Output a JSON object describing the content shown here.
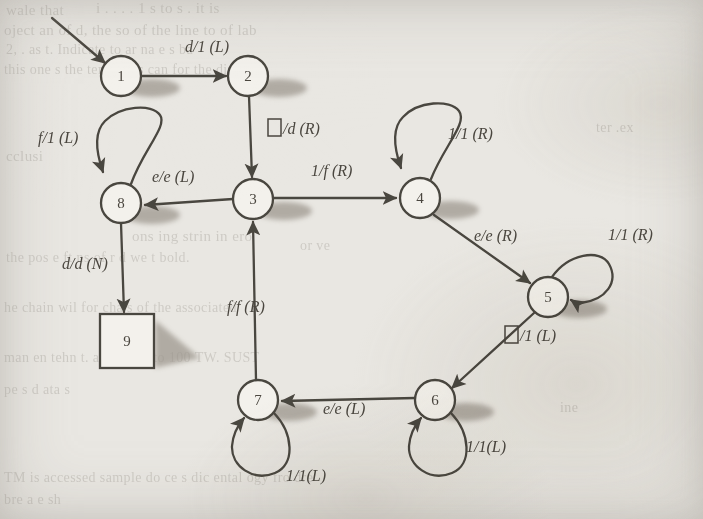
{
  "figure": {
    "type": "state-diagram",
    "background_color": "#e9e7e2",
    "ink_color": "#4a463f",
    "shadow_color": "#9a948b"
  },
  "states": [
    {
      "id": "1",
      "label": "1",
      "shape": "circle",
      "cx": 121,
      "cy": 76,
      "r": 20,
      "accepting": false
    },
    {
      "id": "2",
      "label": "2",
      "shape": "circle",
      "cx": 248,
      "cy": 76,
      "r": 20,
      "accepting": false
    },
    {
      "id": "3",
      "label": "3",
      "shape": "circle",
      "cx": 253,
      "cy": 199,
      "r": 20,
      "accepting": false
    },
    {
      "id": "4",
      "label": "4",
      "shape": "circle",
      "cx": 420,
      "cy": 198,
      "r": 20,
      "accepting": false
    },
    {
      "id": "5",
      "label": "5",
      "shape": "circle",
      "cx": 548,
      "cy": 297,
      "r": 20,
      "accepting": false
    },
    {
      "id": "6",
      "label": "6",
      "shape": "circle",
      "cx": 435,
      "cy": 400,
      "r": 20,
      "accepting": false
    },
    {
      "id": "7",
      "label": "7",
      "shape": "circle",
      "cx": 258,
      "cy": 400,
      "r": 20,
      "accepting": false
    },
    {
      "id": "8",
      "label": "8",
      "shape": "circle",
      "cx": 121,
      "cy": 203,
      "r": 20,
      "accepting": false
    },
    {
      "id": "9",
      "label": "9",
      "shape": "square",
      "cx": 127,
      "cy": 341,
      "r": 27,
      "accepting": true
    }
  ],
  "start": {
    "from_state": "1",
    "arrow_start_x": 52,
    "arrow_start_y": 18
  },
  "transitions": [
    {
      "id": "t1",
      "from": "1",
      "to": "2",
      "label": "d/1 (L)",
      "read": "d",
      "write": "1",
      "move": "L",
      "label_x": 185,
      "label_y": 52,
      "kind": "straight"
    },
    {
      "id": "t2",
      "from": "2",
      "to": "3",
      "label": "□/d (R)",
      "read": "blank",
      "write": "d",
      "move": "R",
      "label_x": 268,
      "label_y": 134,
      "kind": "straight"
    },
    {
      "id": "t3",
      "from": "3",
      "to": "8",
      "label": "e/e (L)",
      "read": "e",
      "write": "e",
      "move": "L",
      "label_x": 152,
      "label_y": 182,
      "kind": "straight"
    },
    {
      "id": "t4",
      "from": "3",
      "to": "4",
      "label": "1/f (R)",
      "read": "1",
      "write": "f",
      "move": "R",
      "label_x": 311,
      "label_y": 176,
      "kind": "straight"
    },
    {
      "id": "t5",
      "from": "4",
      "to": "5",
      "label": "e/e (R)",
      "read": "e",
      "write": "e",
      "move": "R",
      "label_x": 474,
      "label_y": 241,
      "kind": "straight"
    },
    {
      "id": "t6",
      "from": "5",
      "to": "6",
      "label": "□/1 (L)",
      "read": "blank",
      "write": "1",
      "move": "L",
      "label_x": 505,
      "label_y": 341,
      "kind": "straight"
    },
    {
      "id": "t7",
      "from": "6",
      "to": "7",
      "label": "e/e (L)",
      "read": "e",
      "write": "e",
      "move": "L",
      "label_x": 323,
      "label_y": 414,
      "kind": "straight"
    },
    {
      "id": "t8",
      "from": "7",
      "to": "3",
      "label": "f/f (R)",
      "read": "f",
      "write": "f",
      "move": "R",
      "label_x": 227,
      "label_y": 312,
      "kind": "straight"
    },
    {
      "id": "t9",
      "from": "8",
      "to": "9",
      "label": "d/d (N)",
      "read": "d",
      "write": "d",
      "move": "N",
      "label_x": 62,
      "label_y": 269,
      "kind": "straight"
    },
    {
      "id": "t10",
      "from": "8",
      "to": "8",
      "label": "f/1 (L)",
      "read": "f",
      "write": "1",
      "move": "L",
      "label_x": 38,
      "label_y": 143,
      "kind": "self-loop-top"
    },
    {
      "id": "t11",
      "from": "4",
      "to": "4",
      "label": "1/1 (R)",
      "read": "1",
      "write": "1",
      "move": "R",
      "label_x": 448,
      "label_y": 139,
      "kind": "self-loop-top"
    },
    {
      "id": "t12",
      "from": "5",
      "to": "5",
      "label": "1/1 (R)",
      "read": "1",
      "write": "1",
      "move": "R",
      "label_x": 608,
      "label_y": 240,
      "kind": "self-loop-right"
    },
    {
      "id": "t13",
      "from": "6",
      "to": "6",
      "label": "1/1(L)",
      "read": "1",
      "write": "1",
      "move": "L",
      "label_x": 466,
      "label_y": 452,
      "kind": "self-loop-bottom"
    },
    {
      "id": "t14",
      "from": "7",
      "to": "7",
      "label": "1/1(L)",
      "read": "1",
      "write": "1",
      "move": "L",
      "label_x": 286,
      "label_y": 481,
      "kind": "self-loop-bottom"
    }
  ],
  "background_ghost_text": [
    {
      "text": "wale that",
      "x": 6,
      "y": 2,
      "size": 15
    },
    {
      "text": "i    .   .   . .    1   s   to  s  .  it is",
      "x": 96,
      "y": 0,
      "size": 15
    },
    {
      "text": "oject an  of d, the  so   of the   line  to   of  lab",
      "x": 4,
      "y": 22,
      "size": 15
    },
    {
      "text": "2,  .  as  t.  Indicate  to  ar  na  e  s  ba",
      "x": 6,
      "y": 42,
      "size": 14
    },
    {
      "text": "this one  s  the   tener   was   can  for  the   diagra",
      "x": 4,
      "y": 62,
      "size": 14
    },
    {
      "text": "cclusi",
      "x": 6,
      "y": 148,
      "size": 15
    },
    {
      "text": "ons   ing   strin  in   ero",
      "x": 132,
      "y": 228,
      "size": 15
    },
    {
      "text": "the  pos   e ft  ns  of  r  d   we  t  bold.",
      "x": 6,
      "y": 250,
      "size": 14
    },
    {
      "text": "he   chain   wil  for  cha    s  of  the   associated",
      "x": 4,
      "y": 300,
      "size": 14
    },
    {
      "text": "man   en  tehn   t.  an  thing       ,  to  100 TW.  SUST",
      "x": 4,
      "y": 350,
      "size": 14
    },
    {
      "text": "pe   s   d    ata   s",
      "x": 4,
      "y": 382,
      "size": 14
    },
    {
      "text": "TM   is  accessed  sample   do  ce  s  dic  ental  ogy  fro   dre",
      "x": 4,
      "y": 470,
      "size": 14
    },
    {
      "text": "bre   a  e  sh",
      "x": 4,
      "y": 492,
      "size": 14
    },
    {
      "text": "ter   .ex",
      "x": 596,
      "y": 120,
      "size": 14
    },
    {
      "text": "or   ve",
      "x": 300,
      "y": 238,
      "size": 14
    },
    {
      "text": "ine",
      "x": 560,
      "y": 400,
      "size": 14
    }
  ]
}
